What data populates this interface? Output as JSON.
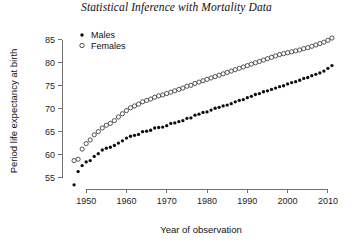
{
  "chart_data": {
    "type": "scatter",
    "title": "Statistical Inference with Mortality Data",
    "xlabel": "Year of observation",
    "ylabel": "Period life expectancy at birth",
    "xlim": [
      1944,
      2013
    ],
    "ylim": [
      52.5,
      86.5
    ],
    "xticks": [
      1950,
      1960,
      1970,
      1980,
      1990,
      2000,
      2010
    ],
    "xtick_labels": [
      "1950",
      "1960",
      "1970",
      "1980",
      "1990",
      "2000",
      "2010"
    ],
    "yticks": [
      55,
      60,
      65,
      70,
      75,
      80,
      85
    ],
    "ytick_labels": [
      "55",
      "60",
      "65",
      "70",
      "75",
      "80",
      "85"
    ],
    "grid": false,
    "legend_position": "top-left",
    "x": [
      1947,
      1948,
      1949,
      1950,
      1951,
      1952,
      1953,
      1954,
      1955,
      1956,
      1957,
      1958,
      1959,
      1960,
      1961,
      1962,
      1963,
      1964,
      1965,
      1966,
      1967,
      1968,
      1969,
      1970,
      1971,
      1972,
      1973,
      1974,
      1975,
      1976,
      1977,
      1978,
      1979,
      1980,
      1981,
      1982,
      1983,
      1984,
      1985,
      1986,
      1987,
      1988,
      1989,
      1990,
      1991,
      1992,
      1993,
      1994,
      1995,
      1996,
      1997,
      1998,
      1999,
      2000,
      2001,
      2002,
      2003,
      2004,
      2005,
      2006,
      2007,
      2008,
      2009,
      2010,
      2011
    ],
    "series": [
      {
        "name": "Males",
        "marker": "filled-circle",
        "color": "#0d0d0d",
        "values": [
          53.4,
          56.3,
          57.6,
          58.4,
          58.7,
          59.6,
          60.2,
          61.0,
          61.4,
          61.6,
          62.0,
          62.5,
          63.0,
          63.6,
          64.0,
          64.2,
          64.4,
          65.0,
          65.1,
          65.3,
          65.8,
          65.9,
          66.0,
          66.3,
          66.8,
          66.9,
          67.2,
          67.4,
          67.9,
          68.0,
          68.6,
          68.8,
          69.2,
          69.3,
          69.7,
          70.1,
          70.3,
          70.6,
          70.8,
          71.1,
          71.5,
          71.8,
          72.0,
          72.4,
          72.7,
          73.1,
          73.3,
          73.7,
          73.9,
          74.2,
          74.5,
          74.8,
          75.0,
          75.4,
          75.7,
          75.9,
          76.2,
          76.6,
          76.8,
          77.2,
          77.5,
          77.8,
          78.2,
          78.8,
          79.4
        ]
      },
      {
        "name": "Females",
        "marker": "open-circle",
        "color": "#ffffff",
        "values": [
          58.7,
          59.0,
          61.2,
          62.4,
          63.2,
          64.3,
          65.0,
          65.8,
          66.4,
          66.8,
          67.4,
          68.2,
          68.9,
          69.6,
          70.2,
          70.6,
          71.0,
          71.5,
          71.8,
          72.1,
          72.5,
          72.8,
          73.0,
          73.3,
          73.6,
          73.9,
          74.2,
          74.5,
          74.9,
          75.1,
          75.5,
          75.8,
          76.1,
          76.4,
          76.7,
          77.0,
          77.3,
          77.6,
          77.9,
          78.2,
          78.5,
          78.8,
          79.1,
          79.4,
          79.7,
          80.0,
          80.3,
          80.6,
          80.9,
          81.2,
          81.5,
          81.8,
          82.0,
          82.2,
          82.4,
          82.6,
          82.8,
          83.1,
          83.3,
          83.6,
          83.9,
          84.2,
          84.5,
          84.9,
          85.4
        ]
      }
    ]
  }
}
